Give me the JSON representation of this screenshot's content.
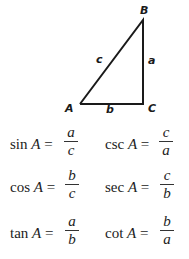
{
  "triangle": {
    "vertices": {
      "A": "A",
      "B": "B",
      "C": "C"
    },
    "sides": {
      "a": "a",
      "b": "b",
      "c": "c"
    },
    "stroke_color": "#1a1a1a"
  },
  "formulas": [
    {
      "left": {
        "fn": "sin",
        "var": "A",
        "eq": "=",
        "num": "a",
        "den": "c"
      },
      "right": {
        "fn": "csc",
        "var": "A",
        "eq": "=",
        "num": "c",
        "den": "a"
      }
    },
    {
      "left": {
        "fn": "cos",
        "var": "A",
        "eq": "=",
        "num": "b",
        "den": "c"
      },
      "right": {
        "fn": "sec",
        "var": "A",
        "eq": "=",
        "num": "c",
        "den": "b"
      }
    },
    {
      "left": {
        "fn": "tan",
        "var": "A",
        "eq": "=",
        "num": "a",
        "den": "b"
      },
      "right": {
        "fn": "cot",
        "var": "A",
        "eq": "=",
        "num": "b",
        "den": "a"
      }
    }
  ]
}
